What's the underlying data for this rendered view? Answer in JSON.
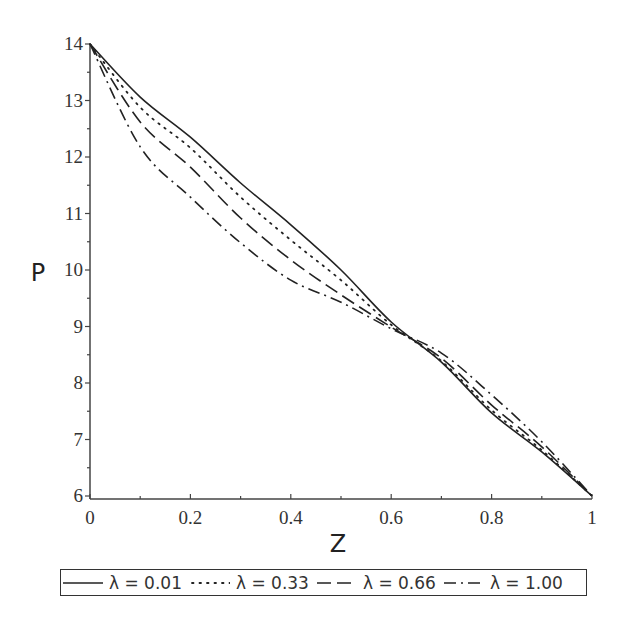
{
  "chart_data": {
    "type": "line",
    "title": "",
    "xlabel": "Z",
    "ylabel": "P",
    "xlim": [
      0,
      1
    ],
    "ylim": [
      6,
      14
    ],
    "grid": false,
    "legend_position": "bottom",
    "x_ticks": [
      "0",
      "0.2",
      "0.4",
      "0.6",
      "0.8",
      "1"
    ],
    "y_ticks": [
      "6",
      "7",
      "8",
      "9",
      "10",
      "11",
      "12",
      "13",
      "14"
    ],
    "x": [
      0,
      0.1,
      0.2,
      0.3,
      0.4,
      0.5,
      0.6,
      0.7,
      0.8,
      0.9,
      1.0
    ],
    "series": [
      {
        "name": "λ = 0.01",
        "style": "solid",
        "values": [
          14.0,
          13.06,
          12.35,
          11.54,
          10.8,
          10.0,
          9.08,
          8.37,
          7.47,
          6.78,
          6.0
        ]
      },
      {
        "name": "λ = 0.33",
        "style": "dotted",
        "values": [
          14.0,
          12.88,
          12.16,
          11.29,
          10.53,
          9.82,
          9.03,
          8.39,
          7.52,
          6.81,
          6.0
        ]
      },
      {
        "name": "λ = 0.66",
        "style": "dashed",
        "values": [
          14.0,
          12.62,
          11.82,
          10.92,
          10.18,
          9.56,
          8.99,
          8.44,
          7.61,
          6.87,
          6.0
        ]
      },
      {
        "name": "λ = 1.00",
        "style": "dashdot",
        "values": [
          14.0,
          12.18,
          11.29,
          10.48,
          9.82,
          9.43,
          8.96,
          8.53,
          7.79,
          6.96,
          6.0
        ]
      }
    ]
  },
  "axes": {
    "xlabel": "Z",
    "ylabel": "P"
  },
  "legend": {
    "items": [
      {
        "label": "λ = 0.01"
      },
      {
        "label": "λ = 0.33"
      },
      {
        "label": "λ = 0.66"
      },
      {
        "label": "λ = 1.00"
      }
    ]
  }
}
